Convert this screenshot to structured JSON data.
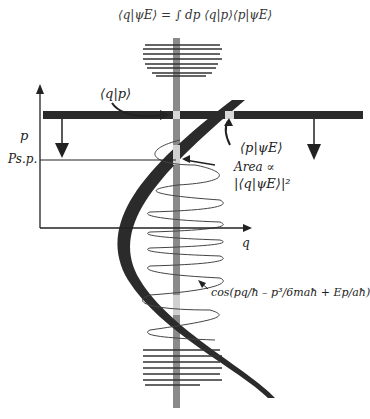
{
  "equation": "⟨q|ψE⟩ = ∫ dp ⟨q|p⟩⟨p|ψE⟩",
  "labels": {
    "qp": "⟨q|p⟩",
    "p_axis": "p",
    "p_sp": "Ps.p.",
    "p_psi": "⟨p|ψE⟩",
    "area": "Area ∝",
    "area_expr": "|⟨q|ψE⟩|²",
    "q_axis": "q",
    "cos_expr": "cos(pq/ħ – p³/6maħ + Ep/aħ)"
  },
  "colors": {
    "band": "#2b2b2b",
    "vertical_strip": "#8a8a8a",
    "highlight": "#cfcfcf",
    "line": "#222222"
  }
}
